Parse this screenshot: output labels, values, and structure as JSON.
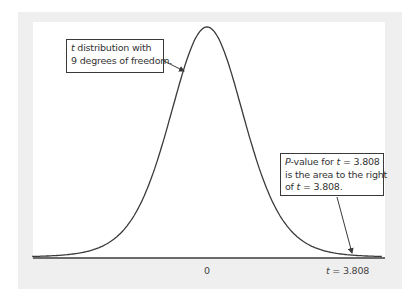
{
  "diagram": {
    "colors": {
      "frame": "#efefef",
      "plot_bg": "#ffffff",
      "curve": "#3a3a3a",
      "text": "#333333"
    }
  },
  "callouts": {
    "distribution": {
      "line1_italic": "t",
      "line1_rest": " distribution with",
      "line2": "9 degrees of freedom."
    },
    "pvalue": {
      "line1_italic": "P",
      "line1_mid": "-value for ",
      "line1_t": "t",
      "line1_end": " = 3.808",
      "line2": "is the area to the right",
      "line3_start": "of ",
      "line3_t": "t",
      "line3_end": " = 3.808."
    }
  },
  "axis": {
    "tick_zero": "0",
    "tick_t_italic": "t",
    "tick_t_value": " = 3.808"
  },
  "chart_data": {
    "type": "line",
    "title": "",
    "distribution": "Student t",
    "degrees_of_freedom": 9,
    "observed_t": 3.808,
    "x_range": [
      -4.6,
      4.6
    ],
    "xlabel": "",
    "ylabel": "",
    "tick_labels": [
      "0",
      "t = 3.808"
    ],
    "tick_positions": [
      0,
      3.808
    ],
    "grid": false,
    "legend": "none",
    "annotations": [
      "t distribution with 9 degrees of freedom.",
      "P-value for t = 3.808 is the area to the right of t = 3.808."
    ]
  }
}
